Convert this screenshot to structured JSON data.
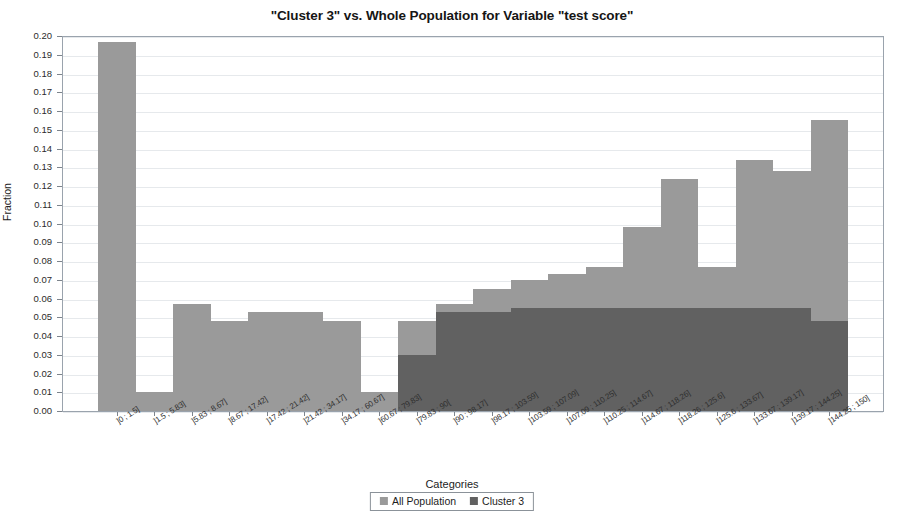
{
  "chart_data": {
    "type": "bar",
    "title": "\"Cluster 3\" vs. Whole Population for Variable \"test score\"",
    "xlabel": "Categories",
    "ylabel": "Fraction",
    "ylim": [
      0,
      0.2
    ],
    "ytick_step": 0.01,
    "grid": true,
    "legend_position": "bottom-center",
    "overlay_mode": "overlaid",
    "colors": {
      "all_population": "#9a9a9a",
      "cluster_3": "#616161",
      "grid": "#e6e9ec",
      "frame": "#9aa3ad"
    },
    "ytick_labels": [
      "0.00",
      "0.01",
      "0.02",
      "0.03",
      "0.04",
      "0.05",
      "0.06",
      "0.07",
      "0.08",
      "0.09",
      "0.10",
      "0.11",
      "0.12",
      "0.13",
      "0.14",
      "0.15",
      "0.16",
      "0.17",
      "0.18",
      "0.19",
      "0.20"
    ],
    "categories": [
      "]0 ; 1.5]",
      "]1.5 ; 5.83]",
      "]5.83 ; 8.67]",
      "]8.67 ; 17.42]",
      "]17.42 ; 21.42]",
      "]21.42 ; 34.17]",
      "]34.17 ; 60.67]",
      "]60.67 ; 79.83]",
      "]79.83 ; 90[",
      "]90 ; 98.17]",
      "]98.17 ; 103.59]",
      "]103.59 ; 107.09]",
      "]107.09 ; 110.25]",
      "]110.25 ; 114.67]",
      "]114.67 ; 118.26]",
      "]118.26 ; 125.6]",
      "]125.6 ; 133.67]",
      "]133.67 ; 139.17]",
      "]139.17 ; 144.25]",
      "]144.25 ; 150]"
    ],
    "series": [
      {
        "name": "All Population",
        "values": [
          0.197,
          0.01,
          0.057,
          0.048,
          0.053,
          0.053,
          0.048,
          0.01,
          0.048,
          0.057,
          0.065,
          0.07,
          0.073,
          0.077,
          0.098,
          0.124,
          0.077,
          0.134,
          0.128,
          0.155
        ]
      },
      {
        "name": "Cluster 3",
        "values": [
          0,
          0,
          0,
          0,
          0,
          0,
          0,
          0,
          0.03,
          0.053,
          0.053,
          0.055,
          0.055,
          0.055,
          0.055,
          0.055,
          0.055,
          0.055,
          0.055,
          0.048
        ]
      }
    ]
  },
  "legend": {
    "entries": [
      {
        "label": "All Population",
        "color": "#9a9a9a"
      },
      {
        "label": "Cluster 3",
        "color": "#616161"
      }
    ]
  }
}
